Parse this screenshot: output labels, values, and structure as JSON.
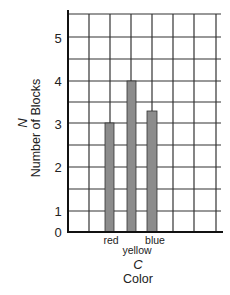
{
  "chart_data": {
    "type": "bar",
    "title": "",
    "categories": [
      "red",
      "yellow",
      "blue"
    ],
    "values": [
      3,
      4,
      3.3
    ],
    "xlabel_symbol": "C",
    "xlabel": "Color",
    "ylabel_symbol": "N",
    "ylabel": "Number of Blocks",
    "yticks": [
      {
        "label": "0",
        "y": 232
      },
      {
        "label": "1",
        "y": 211
      },
      {
        "label": "2",
        "y": 167
      },
      {
        "label": "3",
        "y": 124
      },
      {
        "label": "4",
        "y": 81
      },
      {
        "label": "5",
        "y": 38
      }
    ],
    "ylim": [
      0,
      5
    ],
    "grid": true,
    "bar_color": "#8c8c8c",
    "bar_edge_color": "#333333",
    "grid_color": "#333333"
  },
  "layout": {
    "axis_x": 68,
    "axis_bottom": 232,
    "axis_top": 10,
    "grid_top": 14,
    "grid_right": 221,
    "h_lines": [
      14,
      37,
      59,
      81,
      102,
      123,
      145,
      167,
      189,
      211
    ],
    "v_lines": [
      89,
      110,
      131,
      152,
      173,
      194,
      216
    ],
    "bars": [
      {
        "x": 105,
        "w": 9,
        "top": 123
      },
      {
        "x": 127,
        "w": 9,
        "top": 81
      },
      {
        "x": 147,
        "w": 10,
        "top": 111
      }
    ],
    "xtick_positions": [
      {
        "x": 111,
        "y": 240
      },
      {
        "x": 137,
        "y": 250
      },
      {
        "x": 155,
        "y": 240
      }
    ]
  }
}
